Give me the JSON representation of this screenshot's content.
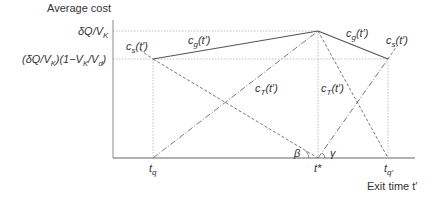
{
  "axes": {
    "y_label": "Average cost",
    "x_label": "Exit time t′",
    "y_ticks": {
      "upper": "δQ/V",
      "upper_sub": "K",
      "lower_prefix": "(δQ/V",
      "lower_sub1": "K",
      "lower_mid": ")(1−V",
      "lower_sub2": "K",
      "lower_mid2": "/V",
      "lower_sub3": "d",
      "lower_suffix": ")"
    },
    "x_ticks": {
      "tq": "t",
      "tq_sub": "q",
      "tstar": "t*",
      "tq2": "t",
      "tq2_sub": "q′"
    }
  },
  "curves": {
    "cs_left": {
      "base": "c",
      "sub": "s",
      "arg": "(t′)"
    },
    "cg_left": {
      "base": "c",
      "sub": "g",
      "arg": "(t′)"
    },
    "cg_right": {
      "base": "c",
      "sub": "g",
      "arg": "(t′)"
    },
    "cs_right": {
      "base": "c",
      "sub": "s",
      "arg": "(t′)"
    },
    "cT_left": {
      "base": "c",
      "sub": "T",
      "arg": "(t′)"
    },
    "cT_right": {
      "base": "c",
      "sub": "T",
      "arg": "(t′)"
    }
  },
  "angles": {
    "beta": "β",
    "gamma": "γ"
  },
  "colors": {
    "line": "#555555",
    "guide": "#aaaaaa",
    "axis": "#999999"
  }
}
